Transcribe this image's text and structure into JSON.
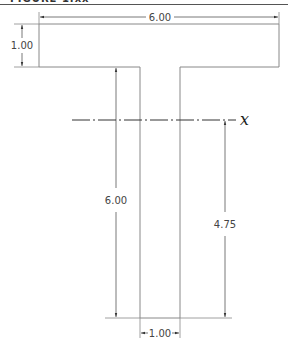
{
  "figure": {
    "title": "FIGURE 1.xx"
  },
  "dimensions": {
    "flange_width": "6.00",
    "flange_thickness": "1.00",
    "total_height": "6.00",
    "web_width": "1.00",
    "centroid_from_bottom": "4.75"
  },
  "axis": {
    "label": "x"
  },
  "colors": {
    "outline": "#888888",
    "dim_line": "#555555",
    "text": "#444444"
  }
}
